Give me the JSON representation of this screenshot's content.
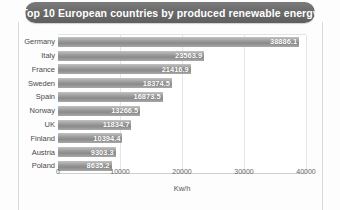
{
  "title": {
    "text": "Top 10 European countries by produced renewable energy",
    "pill_color": "#6a6a6a",
    "text_color": "#ffffff"
  },
  "chart_data": {
    "type": "bar",
    "orientation": "horizontal",
    "title": "Top 10 European countries by produced renewable energy",
    "categories": [
      "Germany",
      "Italy",
      "France",
      "Sweden",
      "Spain",
      "Norway",
      "UK",
      "Finland",
      "Austria",
      "Poland"
    ],
    "values": [
      38886.1,
      23563.9,
      21416.9,
      18374.5,
      16873.5,
      13266.5,
      11834.7,
      10394.4,
      9303.3,
      8635.2
    ],
    "value_labels": [
      "38886.1",
      "23563.9",
      "21416.9",
      "18374.5",
      "16873.5",
      "13266.5",
      "11834.7",
      "10394.4",
      "9303.3",
      "8635.2"
    ],
    "xlabel": "Kw/h",
    "ylabel": "",
    "xlim": [
      0,
      40000
    ],
    "xticks": [
      0,
      10000,
      20000,
      30000,
      40000
    ],
    "xtick_labels": [
      "0",
      "10000",
      "20000",
      "30000",
      "40000"
    ],
    "grid": true,
    "legend": false,
    "bar_color": "#9d9d9d",
    "label_color": "#ffffff"
  }
}
